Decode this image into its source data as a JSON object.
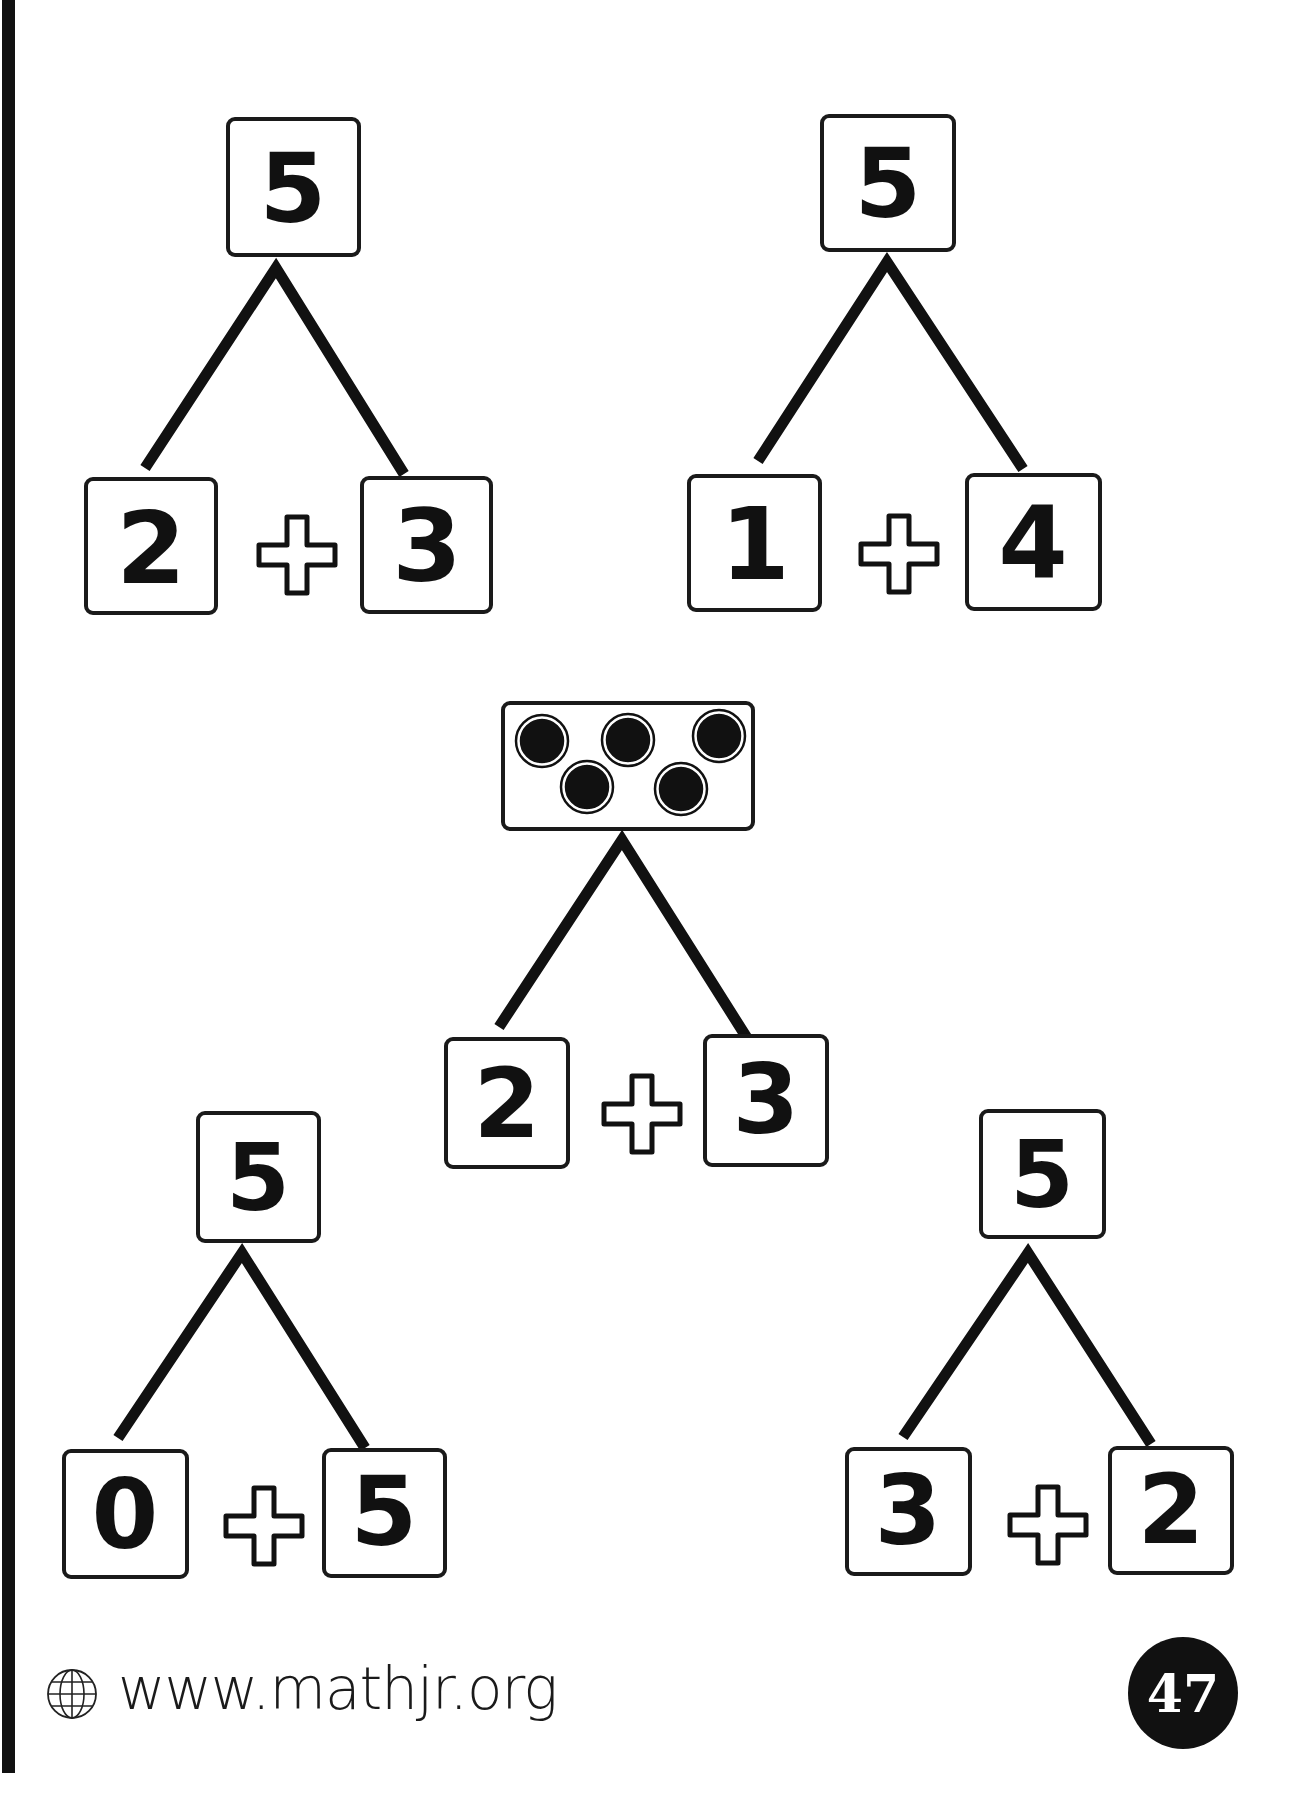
{
  "page": {
    "type": "worksheet",
    "topic": "number bonds of 5",
    "accent_color": "#111111",
    "background_color": "#ffffff"
  },
  "number_bonds": [
    {
      "id": "bond-1",
      "whole": "5",
      "whole_type": "number",
      "part_left": "2",
      "operator": "+",
      "part_right": "3"
    },
    {
      "id": "bond-2",
      "whole": "5",
      "whole_type": "number",
      "part_left": "1",
      "operator": "+",
      "part_right": "4"
    },
    {
      "id": "bond-3",
      "whole": "5",
      "whole_type": "dots",
      "dot_count": 5,
      "part_left": "2",
      "operator": "+",
      "part_right": "3"
    },
    {
      "id": "bond-4",
      "whole": "5",
      "whole_type": "number",
      "part_left": "0",
      "operator": "+",
      "part_right": "5"
    },
    {
      "id": "bond-5",
      "whole": "5",
      "whole_type": "number",
      "part_left": "3",
      "operator": "+",
      "part_right": "2"
    }
  ],
  "footer": {
    "icon": "globe-icon",
    "website": "www.mathjr.org",
    "page_number": "47"
  }
}
